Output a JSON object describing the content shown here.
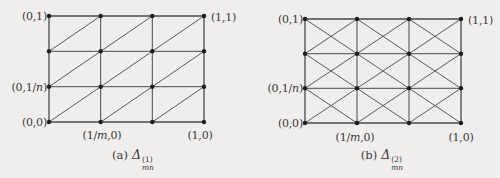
{
  "background_color": "#efeeec",
  "line_color": "#4a4a4a",
  "dot_color": "#1e1e1e",
  "diagrams": [
    {
      "caption_prefix": "(a)",
      "symbol": "Δ",
      "subscript": "mn",
      "superscript": "(1)",
      "grid": {
        "cols": 3,
        "rows": 3,
        "triangulation": "single-diagonal"
      },
      "labels": {
        "top_left": [
          {
            "t": "(0,1)"
          }
        ],
        "top_right": [
          {
            "t": "(1,1)"
          }
        ],
        "mid_left": [
          {
            "t": "(0,1/"
          },
          {
            "t": "n",
            "i": true
          },
          {
            "t": ")"
          }
        ],
        "bottom_left": [
          {
            "t": "(0,0)"
          }
        ],
        "bottom_mid": [
          {
            "t": "(1/"
          },
          {
            "t": "m",
            "i": true
          },
          {
            "t": ",0)"
          }
        ],
        "bottom_right": [
          {
            "t": "(1,0)"
          }
        ]
      }
    },
    {
      "caption_prefix": "(b)",
      "symbol": "Δ",
      "subscript": "mn",
      "superscript": "(2)",
      "grid": {
        "cols": 3,
        "rows": 3,
        "triangulation": "cross-diagonals"
      },
      "labels": {
        "top_left": [
          {
            "t": "(0,1)"
          }
        ],
        "top_right": [
          {
            "t": "(1,1)"
          }
        ],
        "mid_left": [
          {
            "t": "(0,1/"
          },
          {
            "t": "n",
            "i": true
          },
          {
            "t": ")"
          }
        ],
        "bottom_left": [
          {
            "t": "(0,0)"
          }
        ],
        "bottom_mid": [
          {
            "t": "(1/"
          },
          {
            "t": "m",
            "i": true
          },
          {
            "t": ",0)"
          }
        ],
        "bottom_right": [
          {
            "t": "(1,0)"
          }
        ]
      }
    }
  ]
}
